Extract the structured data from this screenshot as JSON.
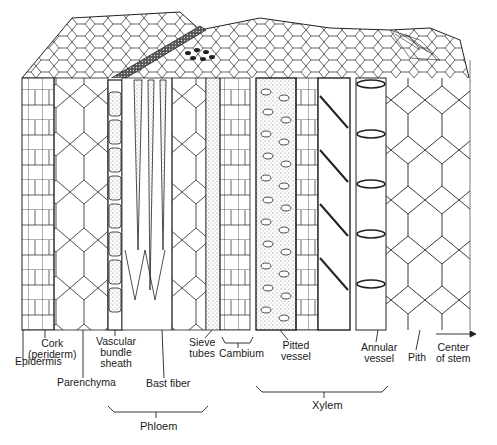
{
  "diagram": {
    "labels": {
      "epidermis": "Epidermis",
      "cork_l1": "Cork",
      "cork_l2": "(periderm)",
      "parenchyma": "Parenchyma",
      "vascular_l1": "Vascular",
      "vascular_l2": "bundle",
      "vascular_l3": "sheath",
      "bast_fiber": "Bast fiber",
      "sieve_l1": "Sieve",
      "sieve_l2": "tubes",
      "cambium": "Cambium",
      "pitted_l1": "Pitted",
      "pitted_l2": "vessel",
      "annular_l1": "Annular",
      "annular_l2": "vessel",
      "pith": "Pith",
      "center_l1": "Center",
      "center_l2": "of stem"
    },
    "groups": {
      "phloem": "Phloem",
      "xylem": "Xylem"
    },
    "colors": {
      "ink": "#1a1a1a",
      "background": "#ffffff",
      "stipple": "#9a9a9a"
    }
  }
}
